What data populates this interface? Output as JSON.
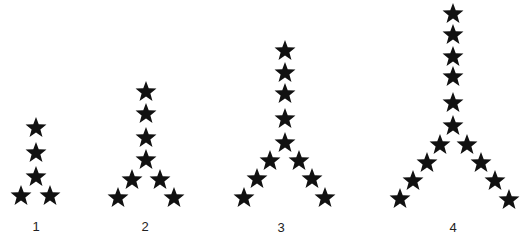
{
  "diagram": {
    "type": "star-pattern-sequence",
    "star_color": "#111111",
    "background": "#ffffff",
    "star_size": 21,
    "figures": [
      {
        "label": "1",
        "label_pos": [
          36,
          226
        ],
        "star_count": 5,
        "stars": [
          [
            36,
            127
          ],
          [
            36,
            152
          ],
          [
            36,
            176
          ],
          [
            21,
            195
          ],
          [
            50,
            195
          ]
        ]
      },
      {
        "label": "2",
        "label_pos": [
          145,
          226
        ],
        "star_count": 8,
        "stars": [
          [
            146,
            91
          ],
          [
            146,
            113
          ],
          [
            146,
            137
          ],
          [
            146,
            159
          ],
          [
            132,
            179
          ],
          [
            118,
            197
          ],
          [
            160,
            179
          ],
          [
            174,
            197
          ]
        ]
      },
      {
        "label": "3",
        "label_pos": [
          281,
          227
        ],
        "star_count": 11,
        "stars": [
          [
            285,
            50
          ],
          [
            285,
            72
          ],
          [
            285,
            93
          ],
          [
            285,
            118
          ],
          [
            285,
            142
          ],
          [
            270,
            160
          ],
          [
            257,
            178
          ],
          [
            244,
            197
          ],
          [
            299,
            160
          ],
          [
            312,
            178
          ],
          [
            325,
            197
          ]
        ]
      },
      {
        "label": "4",
        "label_pos": [
          453,
          227
        ],
        "star_count": 14,
        "stars": [
          [
            453,
            13
          ],
          [
            453,
            34
          ],
          [
            453,
            56
          ],
          [
            453,
            76
          ],
          [
            453,
            102
          ],
          [
            453,
            125
          ],
          [
            440,
            144
          ],
          [
            427,
            162
          ],
          [
            413,
            180
          ],
          [
            400,
            198
          ],
          [
            467,
            144
          ],
          [
            481,
            162
          ],
          [
            495,
            180
          ],
          [
            509,
            199
          ]
        ]
      }
    ]
  }
}
